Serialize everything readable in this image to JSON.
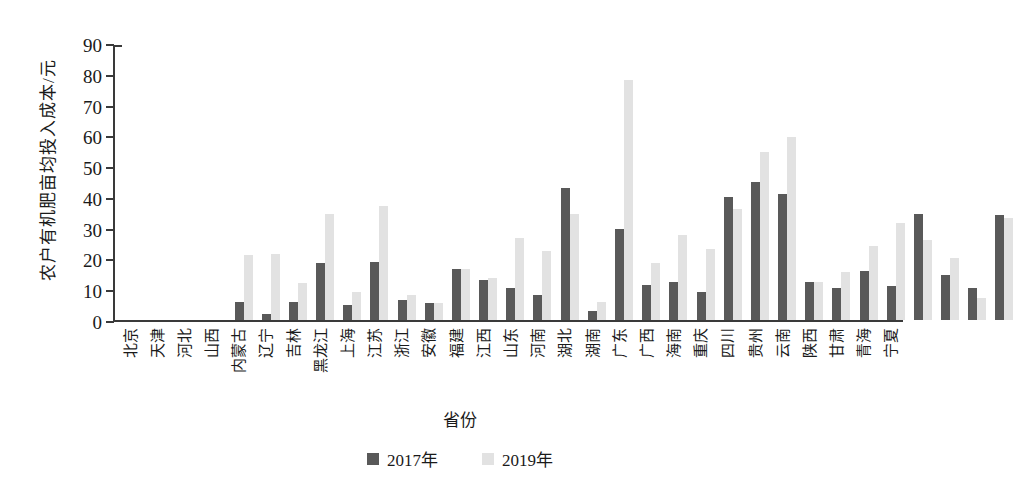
{
  "chart_data": {
    "type": "bar",
    "title": "",
    "xlabel": "省份",
    "ylabel": "农户有机肥亩均投入成本/元",
    "ylim": [
      0,
      90
    ],
    "yticks": [
      0,
      10,
      20,
      30,
      40,
      50,
      60,
      70,
      80,
      90
    ],
    "grid": false,
    "legend_position": "bottom-center",
    "categories": [
      "北京",
      "天津",
      "河北",
      "山西",
      "内蒙古",
      "辽宁",
      "吉林",
      "黑龙江",
      "上海",
      "江苏",
      "浙江",
      "安徽",
      "福建",
      "江西",
      "山东",
      "河南",
      "湖北",
      "湖南",
      "广东",
      "广西",
      "海南",
      "重庆",
      "四川",
      "贵州",
      "云南",
      "陕西",
      "甘肃",
      "青海",
      "宁夏"
    ],
    "series": [
      {
        "name": "2017年",
        "color": "#595959",
        "values": [
          6,
          2,
          6,
          18.5,
          5,
          19,
          6.5,
          5.5,
          16.5,
          13,
          10.5,
          8,
          43,
          3,
          29.5,
          11.5,
          12.5,
          9,
          40,
          45,
          41,
          12.5,
          10.5,
          16,
          11,
          34.5,
          14.5,
          10.5,
          34
        ]
      },
      {
        "name": "2019年",
        "color": "#e2e2e2",
        "values": [
          21,
          21.5,
          12,
          34.5,
          9,
          37,
          8,
          5.5,
          16.5,
          13.5,
          26.5,
          22.5,
          34.5,
          6,
          78,
          18.5,
          27.5,
          23,
          36,
          54.5,
          59.5,
          12.5,
          15.5,
          24,
          31.5,
          26,
          20,
          7,
          33
        ]
      }
    ]
  },
  "legend": {
    "items": [
      {
        "label": "2017年"
      },
      {
        "label": "2019年"
      }
    ]
  }
}
